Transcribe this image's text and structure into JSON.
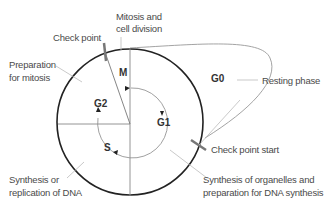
{
  "diagram": {
    "phases": {
      "M": "M",
      "G1": "G1",
      "G2": "G2",
      "S": "S",
      "G0": "G0"
    },
    "labels": {
      "check_point": "Check point",
      "mitosis_line1": "Mitosis and",
      "mitosis_line2": "cell division",
      "prep_mitosis_line1": "Preparation",
      "prep_mitosis_line2": "for mitosis",
      "resting_phase": "Resting phase",
      "check_point_start": "Check point start",
      "synthesis_dna_line1": "Synthesis or",
      "synthesis_dna_line2": "replication of DNA",
      "organelles_line1": "Synthesis of organelles and",
      "organelles_line2": "preparation for DNA synthesis"
    },
    "colors": {
      "circle": "#222222",
      "lines": "#888888",
      "leader": "#bbbbbb",
      "text": "#4a4a4a",
      "checkpoint_bar": "#777777"
    }
  }
}
